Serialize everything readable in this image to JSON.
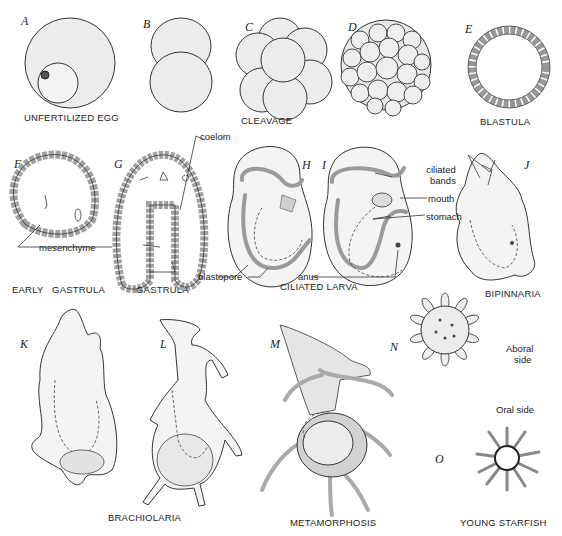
{
  "figure": {
    "panels": [
      {
        "letter": "A",
        "caption": "UNFERTILIZED EGG"
      },
      {
        "letter": "B",
        "caption": ""
      },
      {
        "letter": "C",
        "caption": "CLEAVAGE"
      },
      {
        "letter": "D",
        "caption": ""
      },
      {
        "letter": "E",
        "caption": "BLASTULA"
      },
      {
        "letter": "F",
        "caption": "EARLY GASTRULA"
      },
      {
        "letter": "G",
        "caption": "GASTRULA"
      },
      {
        "letter": "H",
        "caption": ""
      },
      {
        "letter": "I",
        "caption": "CILIATED LARVA"
      },
      {
        "letter": "J",
        "caption": "BIPINNARIA"
      },
      {
        "letter": "K",
        "caption": ""
      },
      {
        "letter": "L",
        "caption": "BRACHIOLARIA"
      },
      {
        "letter": "M",
        "caption": "METAMORPHOSIS"
      },
      {
        "letter": "N",
        "caption": ""
      },
      {
        "letter": "O",
        "caption": "YOUNG STARFISH"
      }
    ],
    "annotations": {
      "coelom": "coelom",
      "mesenchyme": "mesenchyme",
      "blastopore": "blastopore",
      "anus": "anus",
      "ciliated_bands": "ciliated\nbands",
      "ciliated_bands_l1": "ciliated",
      "ciliated_bands_l2": "bands",
      "mouth": "mouth",
      "stomach": "stomach",
      "aboral_l1": "Aboral",
      "aboral_l2": "side",
      "oral_side": "Oral side"
    }
  }
}
